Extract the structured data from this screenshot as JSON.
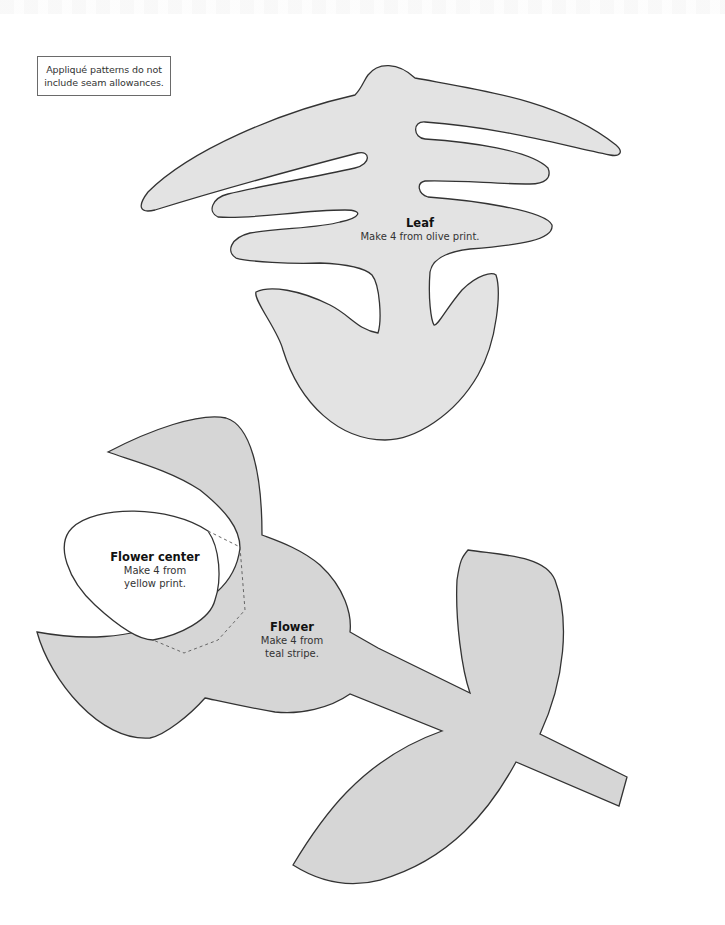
{
  "note": {
    "line1": "Appliqué patterns do not",
    "line2": "include seam allowances."
  },
  "colors": {
    "piece_fill_leaf": "#e3e3e3",
    "piece_fill_flower": "#d6d6d6",
    "outline": "#333333",
    "center_fill": "#ffffff",
    "dashed_line": "#666666"
  },
  "pieces": {
    "leaf": {
      "title": "Leaf",
      "instruction": "Make 4 from olive print."
    },
    "flower_center": {
      "title": "Flower center",
      "instruction_line1": "Make 4 from",
      "instruction_line2": "yellow print."
    },
    "flower": {
      "title": "Flower",
      "instruction_line1": "Make 4 from",
      "instruction_line2": "teal stripe."
    }
  }
}
